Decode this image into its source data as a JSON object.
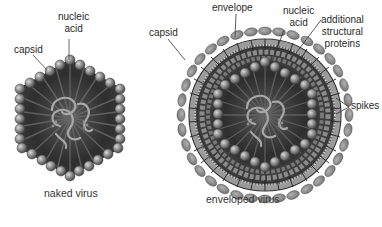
{
  "figure": {
    "naked_virus": {
      "caption": "naked virus",
      "labels": {
        "nucleic_acid_line1": "nucleic",
        "nucleic_acid_line2": "acid",
        "capsid": "capsid"
      }
    },
    "enveloped_virus": {
      "caption": "enveloped virus",
      "labels": {
        "envelope": "envelope",
        "nucleic_acid_line1": "nucleic",
        "nucleic_acid_line2": "acid",
        "additional_line1": "additional",
        "additional_line2": "structural",
        "additional_line3": "proteins",
        "capsid": "capsid",
        "spikes": "spikes"
      }
    },
    "colors": {
      "capsomere": "#7a7a7a",
      "capsid_dark": "#3a3a3a",
      "envelope_band": "#9a9a9a",
      "spike": "#8a8a8a",
      "nucleic_acid": "#a8a8a8",
      "leader_line": "#444444"
    }
  }
}
